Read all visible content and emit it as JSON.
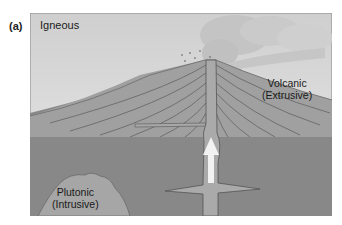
{
  "figure": {
    "panel_label": "(a)",
    "title": "Igneous",
    "labels": {
      "volcanic_line1": "Volcanic",
      "volcanic_line2": "(Extrusive)",
      "plutonic_line1": "Plutonic",
      "plutonic_line2": "(Intrusive)"
    },
    "colors": {
      "sky": "#d4d4d4",
      "volcano": "#9a9a9a",
      "ground": "#878787",
      "pluton": "#a6a6a6",
      "conduit": "#b0b0b0",
      "strata_lines": "#555555",
      "arrow": "#f2f2f2",
      "ash_cloud": "#bdbdbd"
    }
  }
}
